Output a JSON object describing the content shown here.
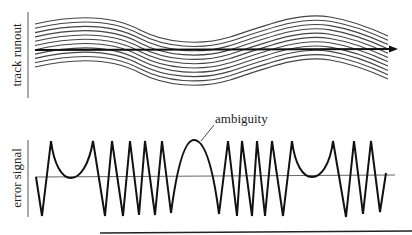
{
  "figure": {
    "top_panel": {
      "ylabel": "track runout",
      "track_count": 11,
      "arrow": "scan-direction-arrow"
    },
    "bottom_panel": {
      "ylabel": "error signal",
      "annotation": "ambiguity"
    }
  },
  "colors": {
    "ink": "#1a1a1a",
    "track": "#444444",
    "axis": "#555555",
    "background": "#ffffff"
  }
}
